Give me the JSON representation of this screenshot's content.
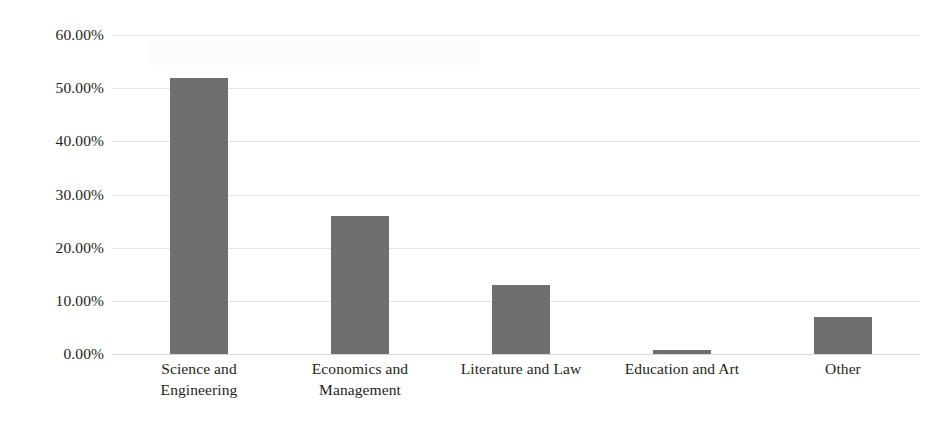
{
  "chart_data": {
    "type": "bar",
    "title": "",
    "subtitle": "",
    "xlabel": "",
    "ylabel": "",
    "categories": [
      "Science and Engineering",
      "Economics and Management",
      "Literature and Law",
      "Education and Art",
      "Other"
    ],
    "category_lines": [
      [
        "Science and",
        "Engineering"
      ],
      [
        "Economics and",
        "Management"
      ],
      [
        "Literature and Law"
      ],
      [
        "Education and Art"
      ],
      [
        "Other"
      ]
    ],
    "values": [
      52.0,
      26.0,
      13.0,
      0.7,
      7.0
    ],
    "value_labels": [
      "52.00%",
      "26.00%",
      "13.00%",
      "0.70%",
      "7.00%"
    ],
    "ylim": [
      0,
      60
    ],
    "ytick_values": [
      0,
      10,
      20,
      30,
      40,
      50,
      60
    ],
    "ytick_labels": [
      "0.00%",
      "10.00%",
      "20.00%",
      "30.00%",
      "40.00%",
      "50.00%",
      "60.00%"
    ],
    "grid": true,
    "grid_axis": "y",
    "legend": false,
    "legend_position": "none",
    "series": [
      {
        "name": "",
        "values": [
          52.0,
          26.0,
          13.0,
          0.7,
          7.0
        ]
      }
    ]
  },
  "style": {
    "bar_color": "#6f6f6f",
    "gridline_color": "#e3e3e3",
    "baseline_color": "#d8d8d8",
    "text_color": "#231f20",
    "background_color": "#ffffff"
  }
}
